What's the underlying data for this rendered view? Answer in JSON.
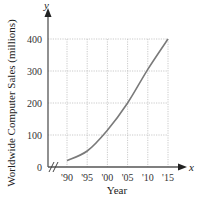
{
  "chart_data": {
    "type": "line",
    "title": "",
    "xlabel": "Year",
    "ylabel": "Worldwide Computer Sales (millions)",
    "x_axis_var": "x",
    "y_axis_var": "y",
    "x_tick_labels": [
      "'90",
      "'95",
      "'00",
      "'05",
      "'10",
      "'15"
    ],
    "y_tick_labels": [
      "0",
      "100",
      "200",
      "300",
      "400"
    ],
    "x": [
      1990,
      1995,
      2000,
      2005,
      2010,
      2015
    ],
    "series": [
      {
        "name": "Worldwide Computer Sales",
        "values": [
          20,
          50,
          115,
          200,
          305,
          400
        ]
      }
    ],
    "xlim": [
      1990,
      2015
    ],
    "ylim": [
      0,
      400
    ],
    "grid": true,
    "axis_break_on_x": true,
    "colors": {
      "line": "#7a7a7a",
      "axis": "#555555",
      "grid": "#bdbdbd"
    }
  }
}
